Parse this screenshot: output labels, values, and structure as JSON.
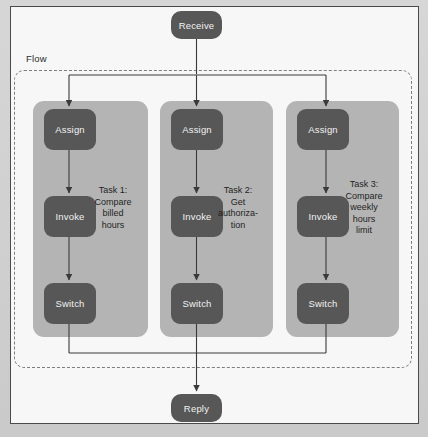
{
  "diagram": {
    "frame_label": "",
    "colors": {
      "page_background": "#d2d2d2",
      "frame_background": "#f7f7f7",
      "frame_border": "#4a4a4a",
      "flow_border": "#7d7d7d",
      "task_column_fill": "#b4b4b4",
      "node_fill": "#575757",
      "node_text": "#f2f2f2",
      "connector": "#3a3a3a"
    },
    "entry_node": {
      "label": "Receive",
      "name": "receive-node"
    },
    "exit_node": {
      "label": "Reply",
      "name": "reply-node"
    },
    "flow": {
      "label": "Flow",
      "branches": [
        {
          "id": "task-1",
          "caption": "Task 1:\nCompare\nbilled\nhours",
          "nodes": [
            {
              "label": "Assign",
              "type": "assign"
            },
            {
              "label": "Invoke",
              "type": "invoke"
            },
            {
              "label": "Switch",
              "type": "switch"
            }
          ]
        },
        {
          "id": "task-2",
          "caption": "Task 2:\nGet\nauthoriza-\ntion",
          "nodes": [
            {
              "label": "Assign",
              "type": "assign"
            },
            {
              "label": "Invoke",
              "type": "invoke"
            },
            {
              "label": "Switch",
              "type": "switch"
            }
          ]
        },
        {
          "id": "task-3",
          "caption": "Task 3:\nCompare\nweekly\nhours\nlimit",
          "nodes": [
            {
              "label": "Assign",
              "type": "assign"
            },
            {
              "label": "Invoke",
              "type": "invoke"
            },
            {
              "label": "Switch",
              "type": "switch"
            }
          ]
        }
      ]
    }
  }
}
